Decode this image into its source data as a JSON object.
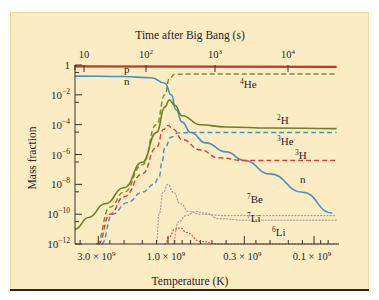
{
  "chart_data": {
    "type": "line",
    "title": "",
    "xlabel": "Temperature (K)",
    "x2label": "Time after Big Bang (s)",
    "ylabel": "Mass fraction",
    "yscale": "log",
    "ylim": [
      1e-12,
      1
    ],
    "xscale": "log",
    "x_unit_note": "temperature in units of 10^9 K, decreasing to the right",
    "xlim": [
      4.5,
      0.07
    ],
    "y_ticks": [
      {
        "exp": 0,
        "label": "1"
      },
      {
        "exp": -2,
        "label": "10",
        "sup": "−2"
      },
      {
        "exp": -4,
        "label": "10",
        "sup": "−4"
      },
      {
        "exp": -6,
        "label": "10",
        "sup": "−6"
      },
      {
        "exp": -8,
        "label": "10",
        "sup": "−8"
      },
      {
        "exp": -10,
        "label": "10",
        "sup": "−10"
      },
      {
        "exp": -12,
        "label": "10",
        "sup": "−12"
      }
    ],
    "x_ticks": [
      {
        "T": 3.0,
        "label": "3.0 × 10",
        "sup": "9"
      },
      {
        "T": 1.0,
        "label": "1.0 × 10",
        "sup": "9"
      },
      {
        "T": 0.3,
        "label": "0.3 × 10",
        "sup": "9"
      },
      {
        "T": 0.1,
        "label": "0.1 × 10",
        "sup": "9"
      }
    ],
    "top_ticks": [
      {
        "px": 84,
        "label": "10",
        "sup": ""
      },
      {
        "px": 146,
        "label": "10",
        "sup": "2"
      },
      {
        "px": 215,
        "label": "10",
        "sup": "3"
      },
      {
        "px": 288,
        "label": "10",
        "sup": "4"
      }
    ],
    "grid": false,
    "legend": "inline labels",
    "series": [
      {
        "name": "p",
        "color": "#c0392b",
        "style": "solid",
        "width": 2.2,
        "points": [
          [
            4.5,
            0.8
          ],
          [
            0.07,
            0.76
          ]
        ]
      },
      {
        "name": "n",
        "color": "#4a8fc0",
        "style": "solid",
        "width": 1.6,
        "points": [
          [
            4.5,
            0.18
          ],
          [
            2.0,
            0.17
          ],
          [
            1.3,
            0.14
          ],
          [
            1.05,
            0.06
          ],
          [
            0.95,
            0.01
          ],
          [
            0.88,
            0.001
          ],
          [
            0.8,
            0.00015
          ],
          [
            0.7,
            3e-05
          ],
          [
            0.55,
            6e-06
          ],
          [
            0.4,
            1.5e-06
          ],
          [
            0.3,
            4e-07
          ],
          [
            0.2,
            5e-08
          ],
          [
            0.12,
            3e-09
          ],
          [
            0.075,
            1.2e-10
          ]
        ]
      },
      {
        "name": "4He",
        "color": "#7d8a2e",
        "style": "dashed",
        "width": 1.4,
        "points": [
          [
            3.1,
            1e-12
          ],
          [
            2.5,
            3e-10
          ],
          [
            2.0,
            3e-09
          ],
          [
            1.5,
            2e-07
          ],
          [
            1.2,
            0.0001
          ],
          [
            1.05,
            0.01
          ],
          [
            0.98,
            0.12
          ],
          [
            0.9,
            0.24
          ],
          [
            0.7,
            0.25
          ],
          [
            0.07,
            0.25
          ]
        ]
      },
      {
        "name": "2H",
        "color": "#6f7f26",
        "style": "solid",
        "width": 1.6,
        "points": [
          [
            4.5,
            1e-11
          ],
          [
            3.5,
            6e-11
          ],
          [
            2.7,
            5e-10
          ],
          [
            2.0,
            6e-09
          ],
          [
            1.5,
            3e-07
          ],
          [
            1.2,
            3e-05
          ],
          [
            1.05,
            0.0015
          ],
          [
            0.98,
            0.0045
          ],
          [
            0.9,
            0.002
          ],
          [
            0.8,
            0.0004
          ],
          [
            0.6,
            0.0001
          ],
          [
            0.4,
            7e-05
          ],
          [
            0.2,
            6e-05
          ],
          [
            0.07,
            5.5e-05
          ]
        ]
      },
      {
        "name": "3He",
        "color": "#4a8fc0",
        "style": "dashed",
        "width": 1.4,
        "points": [
          [
            2.85,
            1e-12
          ],
          [
            2.4,
            1e-10
          ],
          [
            1.9,
            6e-10
          ],
          [
            1.5,
            3e-09
          ],
          [
            1.25,
            1e-08
          ],
          [
            1.15,
            3e-08
          ],
          [
            1.1,
            3e-07
          ],
          [
            1.05,
            3e-06
          ],
          [
            0.95,
            1.5e-05
          ],
          [
            0.85,
            2.8e-05
          ],
          [
            0.7,
            3e-05
          ],
          [
            0.07,
            3e-05
          ]
        ]
      },
      {
        "name": "3H",
        "color": "#d9403a",
        "style": "dashed",
        "width": 1.4,
        "points": [
          [
            3.0,
            1e-12
          ],
          [
            2.5,
            1e-10
          ],
          [
            2.0,
            1.5e-09
          ],
          [
            1.5,
            5e-08
          ],
          [
            1.2,
            3e-06
          ],
          [
            1.07,
            5e-05
          ],
          [
            1.0,
            9e-05
          ],
          [
            0.92,
            5e-05
          ],
          [
            0.8,
            1e-05
          ],
          [
            0.6,
            2e-06
          ],
          [
            0.45,
            6e-07
          ],
          [
            0.3,
            4e-07
          ],
          [
            0.07,
            4e-07
          ]
        ]
      },
      {
        "name": "7Be",
        "color": "#a69b95",
        "style": "dotted",
        "width": 1.2,
        "points": [
          [
            1.2,
            1e-12
          ],
          [
            1.15,
            1e-10
          ],
          [
            1.08,
            3e-09
          ],
          [
            1.0,
            1e-08
          ],
          [
            0.92,
            3e-09
          ],
          [
            0.82,
            5e-10
          ],
          [
            0.72,
            1.5e-10
          ],
          [
            0.6,
            1e-10
          ],
          [
            0.4,
            8e-11
          ],
          [
            0.07,
            8e-11
          ]
        ]
      },
      {
        "name": "7Li",
        "color": "#a69b95",
        "style": "dotted",
        "width": 1.2,
        "points": [
          [
            0.93,
            1e-12
          ],
          [
            0.85,
            3e-11
          ],
          [
            0.75,
            8e-11
          ],
          [
            0.65,
            1.5e-10
          ],
          [
            0.55,
            1.2e-10
          ],
          [
            0.45,
            5e-11
          ],
          [
            0.3,
            4e-11
          ],
          [
            0.07,
            4e-11
          ]
        ]
      },
      {
        "name": "6Li",
        "color": "#e0584a",
        "style": "dotted",
        "width": 1.2,
        "points": [
          [
            1.05,
            1e-12
          ],
          [
            0.98,
            3e-12
          ],
          [
            0.9,
            1e-11
          ],
          [
            0.82,
            1.2e-11
          ],
          [
            0.75,
            6e-12
          ],
          [
            0.6,
            1.5e-12
          ],
          [
            0.45,
            5e-13
          ],
          [
            0.07,
            4e-13
          ]
        ]
      }
    ],
    "annotations": [
      {
        "text": "p",
        "x": 124,
        "y": 73
      },
      {
        "text": "n",
        "x": 124,
        "y": 85
      },
      {
        "text": "He",
        "sup": "4",
        "x": 240,
        "y": 88
      },
      {
        "text": "H",
        "sup": "2",
        "x": 277,
        "y": 124
      },
      {
        "text": "He",
        "sup": "3",
        "x": 277,
        "y": 145
      },
      {
        "text": "H",
        "sup": "3",
        "x": 295,
        "y": 159
      },
      {
        "text": "n",
        "x": 300,
        "y": 183
      },
      {
        "text": "Be",
        "sup": "7",
        "x": 247,
        "y": 203
      },
      {
        "text": "Li",
        "sup": "7",
        "x": 247,
        "y": 222
      },
      {
        "text": "Li",
        "sup": "6",
        "x": 272,
        "y": 236
      }
    ]
  }
}
